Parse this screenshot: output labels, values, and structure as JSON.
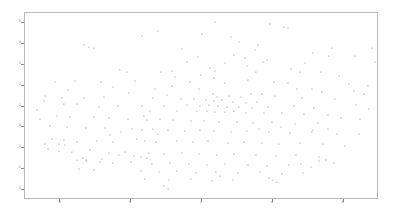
{
  "chart_data": {
    "type": "scatter",
    "title": "",
    "subtitle": "",
    "xlabel": "",
    "ylabel": "",
    "grid": false,
    "legend": null,
    "legend_position": "none",
    "xlim": [
      -3.0,
      7.0
    ],
    "ylim": [
      -3.5,
      5.5
    ],
    "xticks": [
      -2,
      0,
      2,
      4,
      6
    ],
    "xticklabels": [
      "-2",
      "0",
      "2",
      "4",
      "6"
    ],
    "yticks": [
      -3,
      -2,
      -1,
      0,
      1,
      2,
      3,
      4,
      5
    ],
    "yticklabels": [
      "-3",
      "-2",
      "-1",
      "0",
      "1",
      "2",
      "3",
      "4",
      "5"
    ],
    "marker_color": "#666666",
    "label_color": "#4d4d4d",
    "frame_color": "#b9b9b9",
    "background_color": "#ffffff",
    "point_count": 248,
    "note": "Word-embedding projection scatter; individual word labels are rendered below the legible resolution of the source image.",
    "points": [
      {
        "label": "",
        "px": 214,
        "py": 21
      },
      {
        "label": "",
        "px": 269,
        "py": 23
      },
      {
        "label": "",
        "px": 283,
        "py": 26
      },
      {
        "label": "",
        "px": 287,
        "py": 27
      },
      {
        "label": "",
        "px": 157,
        "py": 30
      },
      {
        "label": "",
        "px": 201,
        "py": 33
      },
      {
        "label": "",
        "px": 141,
        "py": 35
      },
      {
        "label": "",
        "px": 238,
        "py": 41
      },
      {
        "label": "",
        "px": 257,
        "py": 44
      },
      {
        "label": "",
        "px": 83,
        "py": 44
      },
      {
        "label": "",
        "px": 88,
        "py": 46
      },
      {
        "label": "",
        "px": 93,
        "py": 47
      },
      {
        "label": "",
        "px": 181,
        "py": 48
      },
      {
        "label": "",
        "px": 331,
        "py": 47
      },
      {
        "label": "",
        "px": 371,
        "py": 47
      },
      {
        "label": "",
        "px": 312,
        "py": 52
      },
      {
        "label": "",
        "px": 328,
        "py": 55
      },
      {
        "label": "",
        "px": 354,
        "py": 55
      },
      {
        "label": "",
        "px": 233,
        "py": 54
      },
      {
        "label": "",
        "px": 197,
        "py": 56
      },
      {
        "label": "",
        "px": 244,
        "py": 57
      },
      {
        "label": "",
        "px": 266,
        "py": 59
      },
      {
        "label": "",
        "px": 262,
        "py": 61
      },
      {
        "label": "",
        "px": 374,
        "py": 61
      },
      {
        "label": "",
        "px": 380,
        "py": 62
      },
      {
        "label": "",
        "px": 119,
        "py": 69
      },
      {
        "label": "",
        "px": 126,
        "py": 71
      },
      {
        "label": "",
        "px": 160,
        "py": 71
      },
      {
        "label": "",
        "px": 171,
        "py": 70
      },
      {
        "label": "",
        "px": 209,
        "py": 67
      },
      {
        "label": "",
        "px": 214,
        "py": 70
      },
      {
        "label": "",
        "px": 255,
        "py": 71
      },
      {
        "label": "",
        "px": 299,
        "py": 71
      },
      {
        "label": "",
        "px": 320,
        "py": 71
      },
      {
        "label": "",
        "px": 338,
        "py": 75
      },
      {
        "label": "",
        "px": 134,
        "py": 80
      },
      {
        "label": "",
        "px": 247,
        "py": 79
      },
      {
        "label": "",
        "px": 273,
        "py": 81
      },
      {
        "label": "",
        "px": 287,
        "py": 82
      },
      {
        "label": "",
        "px": 54,
        "py": 81
      },
      {
        "label": "",
        "px": 74,
        "py": 80
      },
      {
        "label": "",
        "px": 224,
        "py": 82
      },
      {
        "label": "",
        "px": 171,
        "py": 85
      },
      {
        "label": "",
        "px": 154,
        "py": 88
      },
      {
        "label": "",
        "px": 198,
        "py": 88
      },
      {
        "label": "",
        "px": 296,
        "py": 88
      },
      {
        "label": "",
        "px": 311,
        "py": 88
      },
      {
        "label": "",
        "px": 321,
        "py": 91
      },
      {
        "label": "",
        "px": 353,
        "py": 90
      },
      {
        "label": "",
        "px": 363,
        "py": 93
      },
      {
        "label": "",
        "px": 44,
        "py": 95
      },
      {
        "label": "",
        "px": 61,
        "py": 97
      },
      {
        "label": "",
        "px": 83,
        "py": 97
      },
      {
        "label": "",
        "px": 103,
        "py": 96
      },
      {
        "label": "",
        "px": 212,
        "py": 93
      },
      {
        "label": "",
        "px": 216,
        "py": 96
      },
      {
        "label": "",
        "px": 228,
        "py": 95
      },
      {
        "label": "",
        "px": 240,
        "py": 96
      },
      {
        "label": "",
        "px": 250,
        "py": 93
      },
      {
        "label": "",
        "px": 261,
        "py": 93
      },
      {
        "label": "",
        "px": 274,
        "py": 95
      },
      {
        "label": "",
        "px": 301,
        "py": 97
      },
      {
        "label": "",
        "px": 334,
        "py": 98
      },
      {
        "label": "",
        "px": 180,
        "py": 98
      },
      {
        "label": "",
        "px": 193,
        "py": 98
      },
      {
        "label": "",
        "px": 205,
        "py": 99
      },
      {
        "label": "",
        "px": 213,
        "py": 100
      },
      {
        "label": "",
        "px": 221,
        "py": 99
      },
      {
        "label": "",
        "px": 232,
        "py": 101
      },
      {
        "label": "",
        "px": 245,
        "py": 102
      },
      {
        "label": "",
        "px": 256,
        "py": 101
      },
      {
        "label": "",
        "px": 43,
        "py": 100
      },
      {
        "label": "",
        "px": 63,
        "py": 103
      },
      {
        "label": "",
        "px": 76,
        "py": 103
      },
      {
        "label": "",
        "px": 98,
        "py": 106
      },
      {
        "label": "",
        "px": 117,
        "py": 105
      },
      {
        "label": "",
        "px": 141,
        "py": 105
      },
      {
        "label": "",
        "px": 163,
        "py": 105
      },
      {
        "label": "",
        "px": 186,
        "py": 104
      },
      {
        "label": "",
        "px": 199,
        "py": 105
      },
      {
        "label": "",
        "px": 208,
        "py": 104
      },
      {
        "label": "",
        "px": 217,
        "py": 105
      },
      {
        "label": "",
        "px": 226,
        "py": 106
      },
      {
        "label": "",
        "px": 238,
        "py": 106
      },
      {
        "label": "",
        "px": 251,
        "py": 107
      },
      {
        "label": "",
        "px": 267,
        "py": 106
      },
      {
        "label": "",
        "px": 293,
        "py": 105
      },
      {
        "label": "",
        "px": 313,
        "py": 107
      },
      {
        "label": "",
        "px": 355,
        "py": 104
      },
      {
        "label": "",
        "px": 368,
        "py": 108
      },
      {
        "label": "",
        "px": 149,
        "py": 110
      },
      {
        "label": "",
        "px": 176,
        "py": 110
      },
      {
        "label": "",
        "px": 196,
        "py": 110
      },
      {
        "label": "",
        "px": 206,
        "py": 110
      },
      {
        "label": "",
        "px": 214,
        "py": 111
      },
      {
        "label": "",
        "px": 224,
        "py": 111
      },
      {
        "label": "",
        "px": 233,
        "py": 110
      },
      {
        "label": "",
        "px": 245,
        "py": 112
      },
      {
        "label": "",
        "px": 263,
        "py": 112
      },
      {
        "label": "",
        "px": 281,
        "py": 112
      },
      {
        "label": "",
        "px": 303,
        "py": 113
      },
      {
        "label": "",
        "px": 327,
        "py": 114
      },
      {
        "label": "",
        "px": 340,
        "py": 117
      },
      {
        "label": "",
        "px": 56,
        "py": 115
      },
      {
        "label": "",
        "px": 69,
        "py": 116
      },
      {
        "label": "",
        "px": 93,
        "py": 116
      },
      {
        "label": "",
        "px": 108,
        "py": 117
      },
      {
        "label": "",
        "px": 127,
        "py": 118
      },
      {
        "label": "",
        "px": 146,
        "py": 119
      },
      {
        "label": "",
        "px": 159,
        "py": 118
      },
      {
        "label": "",
        "px": 172,
        "py": 119
      },
      {
        "label": "",
        "px": 190,
        "py": 120
      },
      {
        "label": "",
        "px": 203,
        "py": 120
      },
      {
        "label": "",
        "px": 218,
        "py": 121
      },
      {
        "label": "",
        "px": 236,
        "py": 121
      },
      {
        "label": "",
        "px": 252,
        "py": 122
      },
      {
        "label": "",
        "px": 271,
        "py": 121
      },
      {
        "label": "",
        "px": 294,
        "py": 123
      },
      {
        "label": "",
        "px": 317,
        "py": 122
      },
      {
        "label": "",
        "px": 49,
        "py": 125
      },
      {
        "label": "",
        "px": 66,
        "py": 126
      },
      {
        "label": "",
        "px": 85,
        "py": 127
      },
      {
        "label": "",
        "px": 104,
        "py": 127
      },
      {
        "label": "",
        "px": 131,
        "py": 128
      },
      {
        "label": "",
        "px": 141,
        "py": 129
      },
      {
        "label": "",
        "px": 152,
        "py": 128
      },
      {
        "label": "",
        "px": 167,
        "py": 129
      },
      {
        "label": "",
        "px": 184,
        "py": 130
      },
      {
        "label": "",
        "px": 199,
        "py": 129
      },
      {
        "label": "",
        "px": 213,
        "py": 130
      },
      {
        "label": "",
        "px": 230,
        "py": 131
      },
      {
        "label": "",
        "px": 246,
        "py": 130
      },
      {
        "label": "",
        "px": 268,
        "py": 131
      },
      {
        "label": "",
        "px": 289,
        "py": 132
      },
      {
        "label": "",
        "px": 311,
        "py": 131
      },
      {
        "label": "",
        "px": 336,
        "py": 133
      },
      {
        "label": "",
        "px": 358,
        "py": 133
      },
      {
        "label": "",
        "px": 51,
        "py": 138
      },
      {
        "label": "",
        "px": 63,
        "py": 139
      },
      {
        "label": "",
        "px": 76,
        "py": 141
      },
      {
        "label": "",
        "px": 96,
        "py": 140
      },
      {
        "label": "",
        "px": 112,
        "py": 141
      },
      {
        "label": "",
        "px": 136,
        "py": 138
      },
      {
        "label": "",
        "px": 144,
        "py": 140
      },
      {
        "label": "",
        "px": 155,
        "py": 141
      },
      {
        "label": "",
        "px": 176,
        "py": 140
      },
      {
        "label": "",
        "px": 192,
        "py": 141
      },
      {
        "label": "",
        "px": 207,
        "py": 140
      },
      {
        "label": "",
        "px": 227,
        "py": 142
      },
      {
        "label": "",
        "px": 243,
        "py": 141
      },
      {
        "label": "",
        "px": 261,
        "py": 142
      },
      {
        "label": "",
        "px": 278,
        "py": 143
      },
      {
        "label": "",
        "px": 299,
        "py": 142
      },
      {
        "label": "",
        "px": 322,
        "py": 143
      },
      {
        "label": "",
        "px": 344,
        "py": 145
      },
      {
        "label": "",
        "px": 47,
        "py": 148
      },
      {
        "label": "",
        "px": 58,
        "py": 150
      },
      {
        "label": "",
        "px": 71,
        "py": 151
      },
      {
        "label": "",
        "px": 89,
        "py": 149
      },
      {
        "label": "",
        "px": 108,
        "py": 152
      },
      {
        "label": "",
        "px": 124,
        "py": 151
      },
      {
        "label": "",
        "px": 148,
        "py": 152
      },
      {
        "label": "",
        "px": 163,
        "py": 153
      },
      {
        "label": "",
        "px": 181,
        "py": 152
      },
      {
        "label": "",
        "px": 198,
        "py": 153
      },
      {
        "label": "",
        "px": 216,
        "py": 154
      },
      {
        "label": "",
        "px": 233,
        "py": 153
      },
      {
        "label": "",
        "px": 255,
        "py": 154
      },
      {
        "label": "",
        "px": 275,
        "py": 155
      },
      {
        "label": "",
        "px": 295,
        "py": 154
      },
      {
        "label": "",
        "px": 318,
        "py": 156
      },
      {
        "label": "",
        "px": 86,
        "py": 160
      },
      {
        "label": "",
        "px": 99,
        "py": 161
      },
      {
        "label": "",
        "px": 112,
        "py": 162
      },
      {
        "label": "",
        "px": 130,
        "py": 161
      },
      {
        "label": "",
        "px": 151,
        "py": 163
      },
      {
        "label": "",
        "px": 169,
        "py": 162
      },
      {
        "label": "",
        "px": 188,
        "py": 163
      },
      {
        "label": "",
        "px": 206,
        "py": 164
      },
      {
        "label": "",
        "px": 224,
        "py": 163
      },
      {
        "label": "",
        "px": 247,
        "py": 164
      },
      {
        "label": "",
        "px": 266,
        "py": 165
      },
      {
        "label": "",
        "px": 288,
        "py": 164
      },
      {
        "label": "",
        "px": 310,
        "py": 166
      },
      {
        "label": "",
        "px": 333,
        "py": 162
      },
      {
        "label": "",
        "px": 78,
        "py": 168
      },
      {
        "label": "",
        "px": 93,
        "py": 169
      },
      {
        "label": "",
        "px": 140,
        "py": 170
      },
      {
        "label": "",
        "px": 158,
        "py": 171
      },
      {
        "label": "",
        "px": 176,
        "py": 170
      },
      {
        "label": "",
        "px": 195,
        "py": 172
      },
      {
        "label": "",
        "px": 215,
        "py": 171
      },
      {
        "label": "",
        "px": 237,
        "py": 172
      },
      {
        "label": "",
        "px": 259,
        "py": 171
      },
      {
        "label": "",
        "px": 281,
        "py": 173
      },
      {
        "label": "",
        "px": 302,
        "py": 172
      },
      {
        "label": "",
        "px": 144,
        "py": 178
      },
      {
        "label": "",
        "px": 168,
        "py": 179
      },
      {
        "label": "",
        "px": 190,
        "py": 178
      },
      {
        "label": "",
        "px": 211,
        "py": 180
      },
      {
        "label": "",
        "px": 232,
        "py": 179
      },
      {
        "label": "",
        "px": 268,
        "py": 177
      },
      {
        "label": "",
        "px": 272,
        "py": 179
      },
      {
        "label": "",
        "px": 276,
        "py": 181
      },
      {
        "label": "",
        "px": 163,
        "py": 185
      },
      {
        "label": "",
        "px": 167,
        "py": 188
      },
      {
        "label": "",
        "px": 219,
        "py": 175
      },
      {
        "label": "",
        "px": 118,
        "py": 154
      },
      {
        "label": "",
        "px": 133,
        "py": 155
      },
      {
        "label": "",
        "px": 140,
        "py": 156
      },
      {
        "label": "",
        "px": 146,
        "py": 157
      },
      {
        "label": "",
        "px": 85,
        "py": 159
      },
      {
        "label": "",
        "px": 82,
        "py": 157
      },
      {
        "label": "",
        "px": 76,
        "py": 159
      },
      {
        "label": "",
        "px": 101,
        "py": 158
      },
      {
        "label": "",
        "px": 64,
        "py": 144
      },
      {
        "label": "",
        "px": 58,
        "py": 143
      },
      {
        "label": "",
        "px": 44,
        "py": 143
      },
      {
        "label": "",
        "px": 312,
        "py": 129
      },
      {
        "label": "",
        "px": 327,
        "py": 128
      },
      {
        "label": "",
        "px": 300,
        "py": 163
      },
      {
        "label": "",
        "px": 318,
        "py": 160
      },
      {
        "label": "",
        "px": 325,
        "py": 159
      },
      {
        "label": "",
        "px": 359,
        "py": 118
      },
      {
        "label": "",
        "px": 367,
        "py": 85
      },
      {
        "label": "",
        "px": 348,
        "py": 83
      },
      {
        "label": "",
        "px": 304,
        "py": 62
      },
      {
        "label": "",
        "px": 290,
        "py": 68
      },
      {
        "label": "",
        "px": 246,
        "py": 65
      },
      {
        "label": "",
        "px": 224,
        "py": 62
      },
      {
        "label": "",
        "px": 200,
        "py": 74
      },
      {
        "label": "",
        "px": 213,
        "py": 77
      },
      {
        "label": "",
        "px": 189,
        "py": 81
      },
      {
        "label": "",
        "px": 166,
        "py": 94
      },
      {
        "label": "",
        "px": 152,
        "py": 97
      },
      {
        "label": "",
        "px": 128,
        "py": 92
      },
      {
        "label": "",
        "px": 112,
        "py": 86
      },
      {
        "label": "",
        "px": 100,
        "py": 81
      },
      {
        "label": "",
        "px": 67,
        "py": 89
      },
      {
        "label": "",
        "px": 39,
        "py": 118
      },
      {
        "label": "",
        "px": 36,
        "py": 109
      },
      {
        "label": "",
        "px": 230,
        "py": 36
      },
      {
        "label": "",
        "px": 254,
        "py": 49
      },
      {
        "label": "",
        "px": 186,
        "py": 61
      },
      {
        "label": "",
        "px": 174,
        "py": 76
      },
      {
        "label": "",
        "px": 143,
        "py": 115
      },
      {
        "label": "",
        "px": 120,
        "py": 131
      },
      {
        "label": "",
        "px": 109,
        "py": 134
      },
      {
        "label": "",
        "px": 157,
        "py": 133
      },
      {
        "label": "",
        "px": 258,
        "py": 128
      },
      {
        "label": "",
        "px": 280,
        "py": 126
      }
    ]
  },
  "figure": {
    "width": 393,
    "height": 215,
    "plot_left": 24,
    "plot_top": 12,
    "plot_width": 354,
    "plot_height": 187
  }
}
